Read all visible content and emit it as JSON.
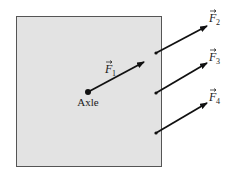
{
  "diagram": {
    "type": "force-diagram",
    "object": {
      "shape": "square",
      "fill": "#e3e3e3",
      "stroke": "#555555"
    },
    "axle": {
      "label": "Axle"
    },
    "forces": [
      {
        "id": "F1",
        "symbol": "F",
        "subscript": "1"
      },
      {
        "id": "F2",
        "symbol": "F",
        "subscript": "2"
      },
      {
        "id": "F3",
        "symbol": "F",
        "subscript": "3"
      },
      {
        "id": "F4",
        "symbol": "F",
        "subscript": "4"
      }
    ],
    "arrow_color": "#111111"
  }
}
